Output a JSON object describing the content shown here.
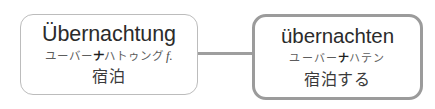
{
  "diagram": {
    "type": "word-relation-diagram",
    "background_color": "#ffffff",
    "connector": {
      "style": "solid-line",
      "color": "#9e9e9e"
    },
    "nodes": [
      {
        "id": "source",
        "role": "noun-entry",
        "headword": "Übernachtung",
        "reading_prefix": "ユーバー",
        "reading_accent": "ナ",
        "reading_suffix": "ハトゥング",
        "part_of_speech": "f.",
        "gloss": "宿泊",
        "border_color": "#bcbcbc",
        "emphasis": "normal"
      },
      {
        "id": "target",
        "role": "verb-entry",
        "headword": "übernachten",
        "reading_prefix": "ユーバー",
        "reading_accent": "ナ",
        "reading_suffix": "ハテン",
        "part_of_speech": "",
        "gloss": "宿泊する",
        "border_color": "#9b9b9b",
        "emphasis": "highlighted"
      }
    ]
  }
}
